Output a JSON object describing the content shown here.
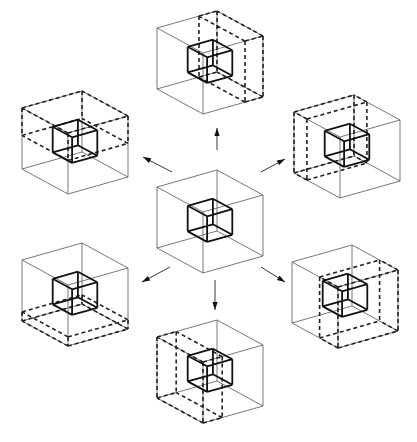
{
  "diagram": {
    "title": "",
    "colors": {
      "background": "#ffffff",
      "line": "#222222",
      "thin_line": "#555555"
    },
    "basis": {
      "a": [
        -46,
        -25
      ],
      "b": [
        60,
        -17
      ],
      "c": [
        0,
        61
      ]
    },
    "inner_cube": {
      "offset": [
        0.29,
        0.29,
        0.27
      ],
      "scale": 0.42
    },
    "cubes": [
      {
        "name": "center",
        "front_top": [
          203,
          212
        ],
        "slab": null
      },
      {
        "name": "top",
        "front_top": [
          203,
          53
        ],
        "slab": {
          "axis": "b",
          "from": 0.7,
          "to": 1.0
        }
      },
      {
        "name": "upper-left",
        "front_top": [
          68,
          133
        ],
        "slab": {
          "axis": "c",
          "from": 0.0,
          "to": 0.45
        }
      },
      {
        "name": "upper-right",
        "front_top": [
          340,
          137
        ],
        "slab": {
          "axis": "a",
          "from": 0.72,
          "to": 1.0
        }
      },
      {
        "name": "lower-left",
        "front_top": [
          68,
          285
        ],
        "slab": {
          "axis": "c",
          "from": 0.85,
          "to": 1.0
        }
      },
      {
        "name": "lower-right",
        "front_top": [
          338,
          287
        ],
        "slab": {
          "axis": "a",
          "from": 0.0,
          "to": 0.4
        }
      },
      {
        "name": "bottom",
        "front_top": [
          203,
          362
        ],
        "slab": {
          "axis": "b",
          "from": 0.0,
          "to": 0.32
        }
      }
    ],
    "arrows": [
      {
        "name": "arrow-up",
        "from": [
          217,
          150
        ],
        "to": [
          217,
          128
        ]
      },
      {
        "name": "arrow-upper-left",
        "from": [
          172,
          172
        ],
        "to": [
          143,
          157
        ]
      },
      {
        "name": "arrow-upper-right",
        "from": [
          261,
          172
        ],
        "to": [
          285,
          159
        ]
      },
      {
        "name": "arrow-lower-left",
        "from": [
          170,
          267
        ],
        "to": [
          142,
          282
        ]
      },
      {
        "name": "arrow-lower-right",
        "from": [
          261,
          267
        ],
        "to": [
          285,
          282
        ]
      },
      {
        "name": "arrow-down",
        "from": [
          215,
          280
        ],
        "to": [
          215,
          310
        ]
      }
    ]
  }
}
